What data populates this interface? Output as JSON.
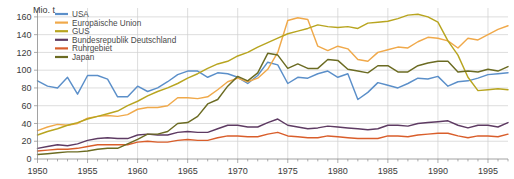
{
  "chart_data": {
    "type": "line",
    "title": "",
    "subtitle": "",
    "xlabel": "",
    "ylabel": "Mio. t",
    "unit_label": "Mio. t",
    "xlim": [
      1950,
      1997
    ],
    "ylim": [
      0,
      170
    ],
    "grid": true,
    "legend_position": "top-left",
    "y_ticks": [
      0,
      20,
      40,
      60,
      80,
      100,
      120,
      140,
      160
    ],
    "y_tick_labels": [
      "0",
      "20",
      "40",
      "60",
      "80",
      "100",
      "120",
      "140",
      "160"
    ],
    "x_ticks": [
      1950,
      1955,
      1960,
      1965,
      1970,
      1975,
      1980,
      1985,
      1990,
      1995
    ],
    "x_tick_labels": [
      "1950",
      "1955",
      "1960",
      "1965",
      "1970",
      "1975",
      "1980",
      "1985",
      "1990",
      "1995"
    ],
    "x_minor_tick_interval": 1,
    "x": [
      1950,
      1951,
      1952,
      1953,
      1954,
      1955,
      1956,
      1957,
      1958,
      1959,
      1960,
      1961,
      1962,
      1963,
      1964,
      1965,
      1966,
      1967,
      1968,
      1969,
      1970,
      1971,
      1972,
      1973,
      1974,
      1975,
      1976,
      1977,
      1978,
      1979,
      1980,
      1981,
      1982,
      1983,
      1984,
      1985,
      1986,
      1987,
      1988,
      1989,
      1990,
      1991,
      1992,
      1993,
      1994,
      1995,
      1996,
      1997
    ],
    "series": [
      {
        "name": "USA",
        "color": "#5b8fc9",
        "values": [
          88,
          82,
          80,
          92,
          73,
          94,
          94,
          90,
          70,
          70,
          82,
          76,
          80,
          87,
          95,
          99,
          99,
          92,
          97,
          96,
          92,
          85,
          94,
          109,
          106,
          85,
          92,
          91,
          96,
          99,
          92,
          96,
          67,
          75,
          86,
          83,
          80,
          85,
          91,
          90,
          93,
          82,
          87,
          88,
          91,
          95,
          96,
          97
        ]
      },
      {
        "name": "Europäische Union",
        "color": "#f0a94a",
        "values": [
          32,
          36,
          39,
          38,
          40,
          46,
          48,
          49,
          48,
          50,
          56,
          58,
          58,
          60,
          69,
          69,
          68,
          70,
          78,
          87,
          91,
          87,
          91,
          101,
          120,
          156,
          159,
          157,
          127,
          122,
          127,
          124,
          112,
          110,
          120,
          123,
          126,
          125,
          132,
          137,
          136,
          133,
          125,
          136,
          134,
          140,
          146,
          150
        ]
      },
      {
        "name": "GUS",
        "color": "#b8a520",
        "values": [
          27,
          31,
          34,
          38,
          41,
          45,
          48,
          51,
          54,
          60,
          65,
          71,
          76,
          80,
          85,
          91,
          96,
          102,
          107,
          110,
          116,
          120,
          126,
          131,
          136,
          141,
          144,
          147,
          151,
          149,
          148,
          149,
          147,
          153,
          154,
          155,
          158,
          162,
          163,
          160,
          154,
          133,
          117,
          92,
          77,
          78,
          79,
          78
        ]
      },
      {
        "name": "Bundesrepublik Deutschland",
        "color": "#5e3b63",
        "values": [
          12,
          14,
          16,
          15,
          17,
          21,
          23,
          24,
          23,
          23,
          27,
          28,
          27,
          27,
          30,
          31,
          30,
          30,
          34,
          38,
          38,
          36,
          36,
          41,
          45,
          38,
          36,
          34,
          35,
          37,
          36,
          35,
          34,
          33,
          34,
          38,
          38,
          37,
          40,
          41,
          42,
          43,
          38,
          35,
          38,
          38,
          36,
          41
        ]
      },
      {
        "name": "Ruhrgebiet",
        "color": "#d95e2b",
        "values": [
          9,
          10,
          11,
          11,
          12,
          14,
          16,
          16,
          16,
          16,
          19,
          20,
          19,
          19,
          21,
          22,
          21,
          21,
          24,
          26,
          26,
          25,
          25,
          28,
          30,
          26,
          25,
          24,
          24,
          26,
          25,
          24,
          23,
          23,
          23,
          26,
          26,
          25,
          27,
          28,
          29,
          29,
          26,
          24,
          26,
          26,
          25,
          28
        ]
      },
      {
        "name": "Japan",
        "color": "#6b6b22",
        "values": [
          5,
          6,
          7,
          8,
          8,
          9,
          11,
          12,
          12,
          17,
          22,
          28,
          28,
          31,
          40,
          41,
          48,
          62,
          67,
          82,
          93,
          88,
          97,
          119,
          117,
          102,
          107,
          102,
          102,
          112,
          111,
          101,
          99,
          97,
          105,
          105,
          98,
          98,
          105,
          108,
          110,
          110,
          98,
          99,
          98,
          101,
          99,
          104
        ]
      }
    ]
  },
  "legend": {
    "items": [
      {
        "label": "USA",
        "color": "#5b8fc9"
      },
      {
        "label": "Europäische Union",
        "color": "#f0a94a"
      },
      {
        "label": "GUS",
        "color": "#b8a520"
      },
      {
        "label": "Bundesrepublik Deutschland",
        "color": "#5e3b63"
      },
      {
        "label": "Ruhrgebiet",
        "color": "#d95e2b"
      },
      {
        "label": "Japan",
        "color": "#6b6b22"
      }
    ]
  },
  "axes": {
    "y_unit": "Mio. t"
  },
  "colors": {
    "background": "#ffffff",
    "grid": "#cfcfcf",
    "axis": "#8a8a8a",
    "text": "#3a3a3a"
  }
}
